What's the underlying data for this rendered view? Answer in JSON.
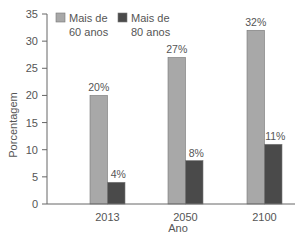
{
  "chart_data": {
    "type": "bar",
    "title": "",
    "xlabel": "Ano",
    "ylabel": "Porcentagem",
    "ylim": [
      0,
      35
    ],
    "yticks": [
      0,
      5,
      10,
      15,
      20,
      25,
      30,
      35
    ],
    "grid": false,
    "legend_position": "top",
    "categories": [
      "2013",
      "2050",
      "2100"
    ],
    "series": [
      {
        "name": "Mais de 60 anos",
        "values": [
          20,
          27,
          32
        ],
        "labels": [
          "20%",
          "27%",
          "32%"
        ],
        "color": "#a8a8a8"
      },
      {
        "name": "Mais de 80 anos",
        "values": [
          4,
          8,
          11
        ],
        "labels": [
          "4%",
          "8%",
          "11%"
        ],
        "color": "#4a4a4a"
      }
    ]
  },
  "legend": {
    "items": [
      {
        "line1": "Mais de",
        "line2": "60 anos",
        "color": "#a8a8a8"
      },
      {
        "line1": "Mais de",
        "line2": "80 anos",
        "color": "#4a4a4a"
      }
    ]
  },
  "colors": {
    "axis": "#666666",
    "text": "#555555",
    "bar_border": "#777777"
  }
}
